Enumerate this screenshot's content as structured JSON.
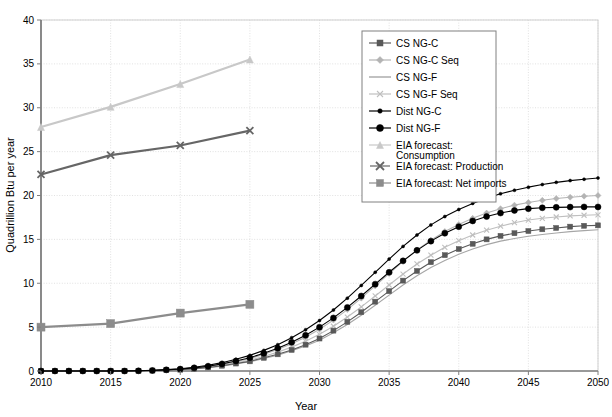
{
  "chart_data": {
    "type": "line",
    "title": "",
    "xlabel": "Year",
    "ylabel": "Quadrillion Btu per year",
    "xlim": [
      2010,
      2050
    ],
    "ylim": [
      0,
      40
    ],
    "xticks": [
      2010,
      2015,
      2020,
      2025,
      2030,
      2035,
      2040,
      2045,
      2050
    ],
    "yticks": [
      0,
      5,
      10,
      15,
      20,
      25,
      30,
      35,
      40
    ],
    "grid": true,
    "legend_position": "upper-right",
    "x": [
      2010,
      2011,
      2012,
      2013,
      2014,
      2015,
      2016,
      2017,
      2018,
      2019,
      2020,
      2021,
      2022,
      2023,
      2024,
      2025,
      2026,
      2027,
      2028,
      2029,
      2030,
      2031,
      2032,
      2033,
      2034,
      2035,
      2036,
      2037,
      2038,
      2039,
      2040,
      2041,
      2042,
      2043,
      2044,
      2045,
      2046,
      2047,
      2048,
      2049,
      2050
    ],
    "series": [
      {
        "name": "CS NG-C",
        "color": "#595959",
        "marker": "square",
        "marker_size": 5,
        "values": [
          0,
          0,
          0,
          0,
          0,
          0,
          0,
          0,
          0.05,
          0.1,
          0.15,
          0.25,
          0.4,
          0.6,
          0.85,
          1.1,
          1.5,
          1.9,
          2.4,
          3.0,
          3.7,
          4.6,
          5.6,
          6.7,
          7.9,
          9.1,
          10.3,
          11.4,
          12.4,
          13.2,
          13.9,
          14.5,
          15.0,
          15.4,
          15.7,
          15.95,
          16.15,
          16.3,
          16.45,
          16.55,
          16.6
        ]
      },
      {
        "name": "CS NG-C Seq",
        "color": "#b3b3b3",
        "marker": "diamond",
        "marker_size": 6,
        "values": [
          0,
          0,
          0,
          0,
          0,
          0,
          0,
          0.02,
          0.06,
          0.12,
          0.2,
          0.33,
          0.5,
          0.75,
          1.05,
          1.4,
          1.9,
          2.45,
          3.1,
          3.85,
          4.75,
          5.8,
          7.0,
          8.3,
          9.7,
          11.1,
          12.5,
          13.8,
          14.9,
          15.9,
          16.7,
          17.4,
          18.0,
          18.5,
          18.9,
          19.2,
          19.45,
          19.65,
          19.8,
          19.92,
          20.0
        ]
      },
      {
        "name": "CS NG-F",
        "color": "#a6a6a6",
        "marker": "none",
        "marker_size": 0,
        "values": [
          0,
          0,
          0,
          0,
          0,
          0,
          0,
          0,
          0.04,
          0.09,
          0.14,
          0.23,
          0.37,
          0.56,
          0.8,
          1.05,
          1.42,
          1.8,
          2.3,
          2.85,
          3.5,
          4.35,
          5.3,
          6.35,
          7.5,
          8.65,
          9.8,
          10.85,
          11.8,
          12.6,
          13.3,
          13.9,
          14.4,
          14.8,
          15.1,
          15.35,
          15.55,
          15.72,
          15.88,
          16.0,
          16.1
        ]
      },
      {
        "name": "CS NG-F Seq",
        "color": "#bfbfbf",
        "marker": "x",
        "marker_size": 5,
        "values": [
          0,
          0,
          0,
          0,
          0,
          0,
          0,
          0.01,
          0.05,
          0.1,
          0.17,
          0.28,
          0.44,
          0.66,
          0.93,
          1.23,
          1.66,
          2.15,
          2.72,
          3.38,
          4.18,
          5.1,
          6.15,
          7.3,
          8.55,
          9.8,
          11.05,
          12.2,
          13.2,
          14.1,
          14.85,
          15.5,
          16.05,
          16.5,
          16.9,
          17.2,
          17.4,
          17.55,
          17.68,
          17.75,
          17.8
        ]
      },
      {
        "name": "Dist NG-C",
        "color": "#000000",
        "marker": "circle-small",
        "marker_size": 3,
        "values": [
          0,
          0,
          0,
          0,
          0,
          0,
          0.01,
          0.03,
          0.08,
          0.16,
          0.26,
          0.42,
          0.65,
          0.95,
          1.33,
          1.78,
          2.35,
          3.0,
          3.8,
          4.7,
          5.75,
          6.95,
          8.3,
          9.75,
          11.25,
          12.75,
          14.2,
          15.5,
          16.65,
          17.6,
          18.4,
          19.1,
          19.7,
          20.2,
          20.6,
          20.95,
          21.25,
          21.5,
          21.7,
          21.85,
          22.0
        ]
      },
      {
        "name": "Dist NG-F",
        "color": "#000000",
        "marker": "circle-large",
        "marker_size": 6,
        "values": [
          0,
          0,
          0,
          0,
          0,
          0,
          0,
          0.02,
          0.06,
          0.13,
          0.22,
          0.36,
          0.55,
          0.81,
          1.14,
          1.52,
          2.02,
          2.6,
          3.28,
          4.07,
          5.0,
          6.05,
          7.25,
          8.55,
          9.9,
          11.25,
          12.55,
          13.75,
          14.8,
          15.7,
          16.45,
          17.1,
          17.6,
          18.0,
          18.3,
          18.5,
          18.6,
          18.65,
          18.68,
          18.7,
          18.7
        ]
      }
    ],
    "forecast_series": [
      {
        "name": "EIA forecast: Consumption",
        "color": "#c8c8c8",
        "marker": "triangle",
        "marker_size": 7,
        "x": [
          2010,
          2015,
          2020,
          2025
        ],
        "values": [
          27.8,
          30.1,
          32.7,
          35.5
        ]
      },
      {
        "name": "EIA forecast: Production",
        "color": "#666666",
        "marker": "X",
        "marker_size": 7,
        "x": [
          2010,
          2015,
          2020,
          2025
        ],
        "values": [
          22.4,
          24.6,
          25.7,
          27.4
        ]
      },
      {
        "name": "EIA forecast: Net imports",
        "color": "#8c8c8c",
        "marker": "square-large",
        "marker_size": 8,
        "x": [
          2010,
          2015,
          2020,
          2025
        ],
        "values": [
          5.0,
          5.4,
          6.6,
          7.6
        ]
      }
    ]
  },
  "legend": {
    "items": [
      {
        "label": "CS NG-C",
        "marker": "square",
        "color": "#595959"
      },
      {
        "label": "CS NG-C Seq",
        "marker": "diamond",
        "color": "#b3b3b3"
      },
      {
        "label": "CS NG-F",
        "marker": "none",
        "color": "#a6a6a6"
      },
      {
        "label": "CS NG-F Seq",
        "marker": "x",
        "color": "#bfbfbf"
      },
      {
        "label": "Dist NG-C",
        "marker": "circle-small",
        "color": "#000000"
      },
      {
        "label": "Dist NG-F",
        "marker": "circle-large",
        "color": "#000000"
      },
      {
        "label": "EIA forecast: Consumption",
        "marker": "triangle",
        "color": "#c8c8c8"
      },
      {
        "label": "EIA forecast: Production",
        "marker": "X",
        "color": "#666666"
      },
      {
        "label": "EIA forecast: Net imports",
        "marker": "square-large",
        "color": "#8c8c8c"
      }
    ]
  },
  "axes": {
    "x_title": "Year",
    "y_title": "Quadrillion Btu per year",
    "x_tick_labels": [
      "2010",
      "2015",
      "2020",
      "2025",
      "2030",
      "2035",
      "2040",
      "2045",
      "2050"
    ],
    "y_tick_labels": [
      "0",
      "5",
      "10",
      "15",
      "20",
      "25",
      "30",
      "35",
      "40"
    ]
  },
  "colors": {
    "grid": "#d9d9d9",
    "axis": "#7f7f7f",
    "background": "#ffffff",
    "legend_border": "#808080"
  }
}
